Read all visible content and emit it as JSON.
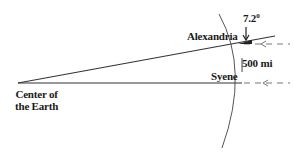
{
  "diagram": {
    "labels": {
      "alexandria": "Alexandria",
      "syene": "Syene",
      "distance": "500 mi",
      "angle_value": "7.2",
      "angle_unit": "0",
      "center_line1": "Center of",
      "center_line2": "the Earth"
    },
    "colors": {
      "line": "#333333",
      "arc": "#555555",
      "sunray": "#777777",
      "text": "#1a1a1a"
    }
  }
}
